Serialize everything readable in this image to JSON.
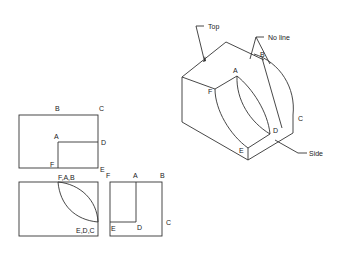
{
  "diagram": {
    "isometric": {
      "callouts": {
        "top": "Top",
        "no_line": "No line",
        "side": "Side"
      },
      "labels": {
        "A": "A",
        "B": "B",
        "C": "C",
        "D": "D",
        "E": "E",
        "F": "F"
      }
    },
    "front_view": {
      "labels": {
        "B": "B",
        "C": "C",
        "A": "A",
        "D": "D",
        "F": "F",
        "E": "E"
      }
    },
    "top_view": {
      "labels": {
        "top": "F,A,B",
        "bottom": "E,D,C"
      }
    },
    "side_view": {
      "labels": {
        "F": "F",
        "A": "A",
        "B": "B",
        "E": "E",
        "D": "D",
        "C": "C"
      }
    }
  },
  "colors": {
    "line": "#333333",
    "background": "#ffffff"
  }
}
